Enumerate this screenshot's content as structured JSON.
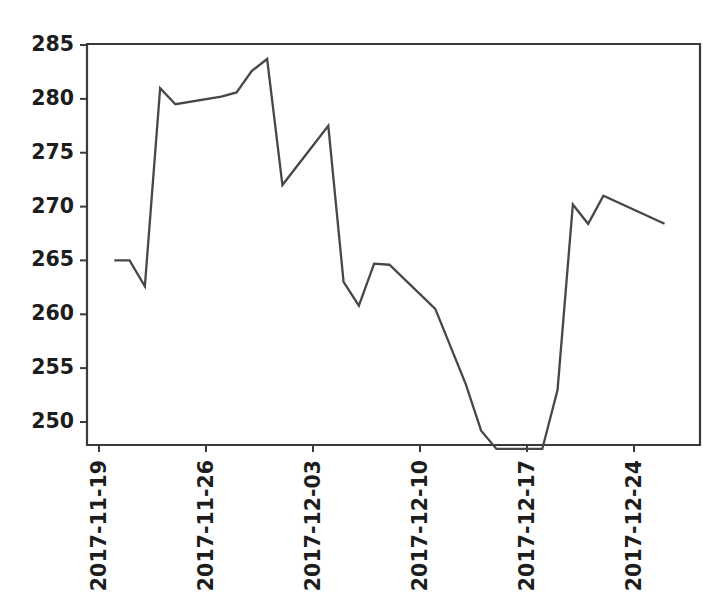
{
  "chart_data": {
    "type": "line",
    "title": "",
    "xlabel": "",
    "ylabel": "",
    "grid": false,
    "legend": "none",
    "line_color": "#474747",
    "background_color": "#ffffff",
    "axis_color": "#3a3a3a",
    "ylim": [
      246.5,
      285.6
    ],
    "xlim": [
      "2017-11-18",
      "2017-12-27"
    ],
    "yticks": [
      250,
      255,
      260,
      265,
      270,
      275,
      280,
      285
    ],
    "ytick_labels": [
      "250",
      "255",
      "260",
      "265",
      "270",
      "275",
      "280",
      "285"
    ],
    "xticks": [
      "2017-11-19",
      "2017-11-26",
      "2017-12-03",
      "2017-12-10",
      "2017-12-17",
      "2017-12-24"
    ],
    "xtick_labels": [
      "2017-11-19",
      "2017-11-26",
      "2017-12-03",
      "2017-12-10",
      "2017-12-17",
      "2017-12-24"
    ],
    "xtick_rotation": 90,
    "x": [
      "2017-11-20",
      "2017-11-21",
      "2017-11-22",
      "2017-11-23",
      "2017-11-24",
      "2017-11-27",
      "2017-11-28",
      "2017-11-29",
      "2017-11-30",
      "2017-12-01",
      "2017-12-04",
      "2017-12-05",
      "2017-12-06",
      "2017-12-07",
      "2017-12-08",
      "2017-12-11",
      "2017-12-12",
      "2017-12-13",
      "2017-12-14",
      "2017-12-15",
      "2017-12-18",
      "2017-12-19",
      "2017-12-20",
      "2017-12-21",
      "2017-12-22",
      "2017-12-26"
    ],
    "values": [
      265.0,
      265.0,
      262.6,
      281.0,
      279.5,
      280.2,
      280.6,
      282.6,
      283.7,
      272.0,
      277.5,
      263.0,
      260.8,
      264.7,
      264.6,
      260.5,
      257.0,
      253.5,
      249.2,
      247.5,
      247.5,
      253.0,
      270.2,
      268.4,
      271.0,
      268.4
    ],
    "series_name": "price"
  },
  "axes": {
    "left_px": 87,
    "right_px": 700,
    "top_px": 44,
    "bottom_px": 445
  }
}
